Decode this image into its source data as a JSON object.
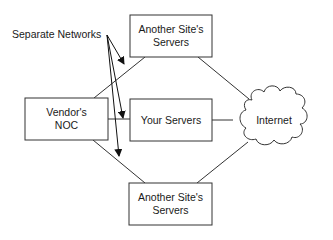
{
  "diagram": {
    "annotation": "Separate Networks",
    "nodes": {
      "vendor_noc": {
        "line1": "Vendor's",
        "line2": "NOC"
      },
      "your_servers": {
        "label": "Your Servers"
      },
      "site_top": {
        "line1": "Another Site's",
        "line2": "Servers"
      },
      "site_bottom": {
        "line1": "Another Site's",
        "line2": "Servers"
      },
      "internet": {
        "label": "Internet"
      }
    }
  }
}
